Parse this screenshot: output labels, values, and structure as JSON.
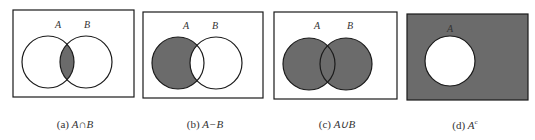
{
  "colors": {
    "fill": "#6b6b6b",
    "stroke": "#1a1a1a",
    "background": "#ffffff"
  },
  "panels": [
    {
      "id": "a",
      "label": "(a)",
      "expression": "A∩B",
      "set_labels": [
        "A",
        "B"
      ],
      "shaded": "intersection"
    },
    {
      "id": "b",
      "label": "(b)",
      "expression": "A−B",
      "set_labels": [
        "A",
        "B"
      ],
      "shaded": "difference"
    },
    {
      "id": "c",
      "label": "(c)",
      "expression": "A∪B",
      "set_labels": [
        "A",
        "B"
      ],
      "shaded": "union"
    },
    {
      "id": "d",
      "label": "(d)",
      "expression": "A",
      "superscript": "c",
      "set_labels": [
        "A"
      ],
      "shaded": "complement"
    }
  ]
}
